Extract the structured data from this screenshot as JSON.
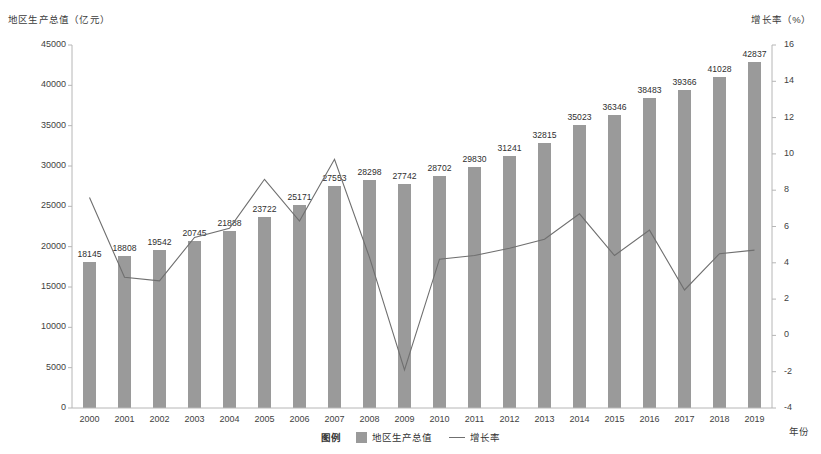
{
  "chart_data": {
    "type": "bar",
    "title": "",
    "xlabel": "年份",
    "ylabel": "地区生产总值（亿元）",
    "y2label": "增长率（%）",
    "categories": [
      "2000",
      "2001",
      "2002",
      "2003",
      "2004",
      "2005",
      "2006",
      "2007",
      "2008",
      "2009",
      "2010",
      "2011",
      "2012",
      "2013",
      "2014",
      "2015",
      "2016",
      "2017",
      "2018",
      "2019"
    ],
    "series": [
      {
        "name": "地区生产总值",
        "type": "bar",
        "axis": "left",
        "color": "#9a9a9a",
        "values": [
          18145,
          18808,
          19542,
          20745,
          21888,
          23722,
          25171,
          27553,
          28298,
          27742,
          28702,
          29830,
          31241,
          32815,
          35023,
          36346,
          38483,
          39366,
          41028,
          42837
        ]
      },
      {
        "name": "增长率",
        "type": "line",
        "axis": "right",
        "color": "#6f6f6f",
        "values": [
          7.6,
          3.2,
          3.0,
          5.4,
          5.9,
          8.6,
          6.3,
          9.7,
          4.3,
          -1.9,
          4.2,
          4.4,
          4.8,
          5.3,
          6.7,
          4.4,
          5.8,
          2.5,
          4.5,
          4.7
        ]
      }
    ],
    "ylim": [
      0,
      45000
    ],
    "yticks": [
      "0",
      "5000",
      "10000",
      "15000",
      "20000",
      "25000",
      "30000",
      "35000",
      "40000",
      "45000"
    ],
    "y2lim": [
      -4,
      16
    ],
    "y2ticks": [
      "-4",
      "-2",
      "0",
      "2",
      "4",
      "6",
      "8",
      "10",
      "12",
      "14",
      "16"
    ],
    "grid": false,
    "legend_position": "bottom",
    "legend_title": "图例",
    "bar_labels_shown": true
  },
  "legend": {
    "title": "图例",
    "bar_label": "地区生产总值",
    "line_label": "增长率"
  },
  "axes": {
    "left_title": "地区生产总值（亿元）",
    "right_title": "增长率（%）",
    "x_title": "年份"
  }
}
